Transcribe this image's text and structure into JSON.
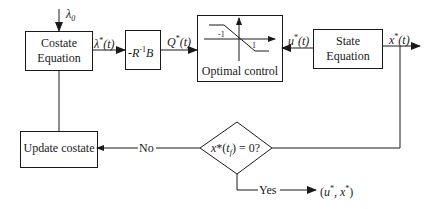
{
  "diagram": {
    "title": "",
    "nodes": {
      "costate_equation": {
        "line1": "Costate",
        "line2": "Equation"
      },
      "gain_block": {
        "prefix": "-",
        "R": "R",
        "exp": "-1",
        "B": "B"
      },
      "optimal_control": {
        "label": "Optimal control",
        "tick_neg": "-1",
        "tick_pos": "1"
      },
      "state_equation": {
        "line1": "State",
        "line2": "Equation"
      },
      "decision": {
        "label_x": "x",
        "label_star": "*",
        "label_paren_open": "(",
        "label_t": "t",
        "label_sub": "f",
        "label_rest": ") = 0?"
      },
      "update_costate": {
        "label": "Update costate"
      }
    },
    "signals": {
      "lambda0": {
        "sym": "λ",
        "sub": "0"
      },
      "lambda_star": {
        "sym": "λ",
        "star": "*",
        "arg": "(t)"
      },
      "q_star": {
        "sym": "Q",
        "star": "*",
        "arg": "(t)"
      },
      "u_star": {
        "sym": "u",
        "star": "*",
        "arg": "(t)"
      },
      "x_star": {
        "sym": "x",
        "star": "*",
        "arg": "(t)"
      }
    },
    "branches": {
      "no": "No",
      "yes": "Yes",
      "output": {
        "open": "(",
        "u": "u",
        "star1": "*",
        "comma": ", ",
        "x": "x",
        "star2": "*",
        "close": ")"
      }
    },
    "colors": {
      "line": "#1a1a1a",
      "background": "#ffffff"
    }
  }
}
